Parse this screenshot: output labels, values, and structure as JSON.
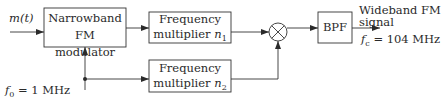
{
  "diagram": {
    "input": {
      "label": "m(t)"
    },
    "oscillator": {
      "label": "f_0 = 1 MHz",
      "symbol": "f",
      "subscript": "0",
      "value": "= 1 MHz"
    },
    "blocks": [
      {
        "id": "nbfm",
        "line1": "Narrowband",
        "line2": "FM modulator"
      },
      {
        "id": "mult1",
        "line1": "Frequency",
        "line2_text": "multiplier ",
        "line2_var": "n",
        "line2_sub": "1"
      },
      {
        "id": "mult2",
        "line1": "Frequency",
        "line2_text": "multiplier ",
        "line2_var": "n",
        "line2_sub": "2"
      },
      {
        "id": "mixer",
        "symbol": "⊗"
      },
      {
        "id": "bpf",
        "label": "BPF"
      }
    ],
    "output": {
      "line1": "Wideband FM",
      "line2": "signal",
      "carrier_symbol": "f",
      "carrier_sub": "c",
      "carrier_value": "= 104 MHz"
    }
  }
}
